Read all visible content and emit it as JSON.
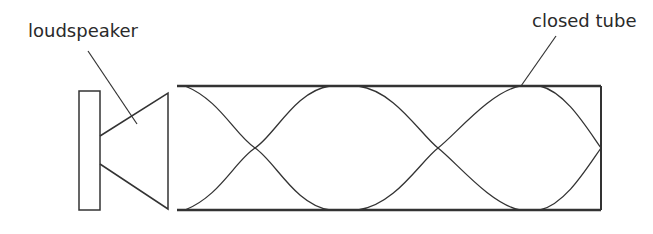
{
  "labels": {
    "loudspeaker": "loudspeaker",
    "tube": "closed tube"
  },
  "colors": {
    "stroke": "#333333",
    "background": "#ffffff"
  }
}
